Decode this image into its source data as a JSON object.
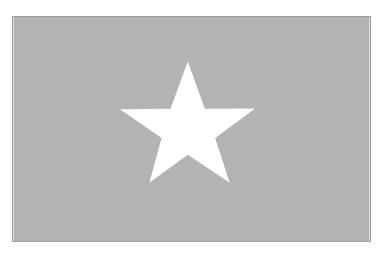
{
  "flag": {
    "background_color": "#b3b3b3",
    "border_color": "#9e9e9e",
    "emblem": "white-five-pointed-star-icon",
    "star_color": "#ffffff"
  }
}
